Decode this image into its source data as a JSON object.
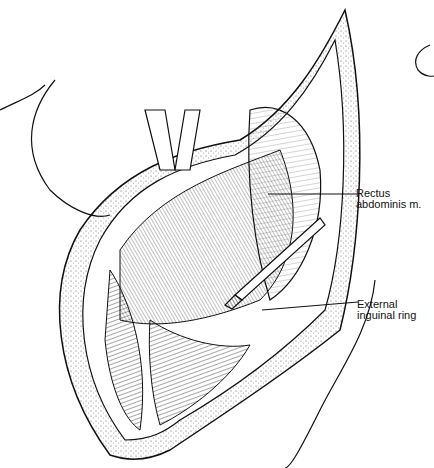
{
  "figure": {
    "type": "anatomical line illustration",
    "labels": [
      {
        "id": "rectus",
        "lines": [
          "Rectus",
          "abdominis m."
        ]
      },
      {
        "id": "inguinal",
        "lines": [
          "External",
          "inguinal ring"
        ]
      }
    ],
    "colors": {
      "ink": "#111111",
      "background": "#ffffff"
    }
  }
}
